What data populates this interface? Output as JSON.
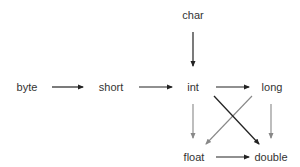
{
  "diagram": {
    "title": "",
    "nodes": [
      {
        "id": "char",
        "label": "char"
      },
      {
        "id": "byte",
        "label": "byte"
      },
      {
        "id": "short",
        "label": "short"
      },
      {
        "id": "int",
        "label": "int"
      },
      {
        "id": "long",
        "label": "long"
      },
      {
        "id": "float",
        "label": "float"
      },
      {
        "id": "double",
        "label": "double"
      }
    ],
    "edges": [
      {
        "from": "char",
        "to": "int",
        "style": "solid-black"
      },
      {
        "from": "byte",
        "to": "short",
        "style": "solid-black"
      },
      {
        "from": "short",
        "to": "int",
        "style": "solid-black"
      },
      {
        "from": "int",
        "to": "long",
        "style": "solid-black"
      },
      {
        "from": "int",
        "to": "float",
        "style": "gray"
      },
      {
        "from": "int",
        "to": "double",
        "style": "solid-black"
      },
      {
        "from": "long",
        "to": "float",
        "style": "gray"
      },
      {
        "from": "long",
        "to": "double",
        "style": "gray"
      },
      {
        "from": "float",
        "to": "double",
        "style": "solid-black"
      }
    ],
    "colors": {
      "black_edge": "#222222",
      "gray_edge": "#888888",
      "text": "#333333"
    }
  }
}
